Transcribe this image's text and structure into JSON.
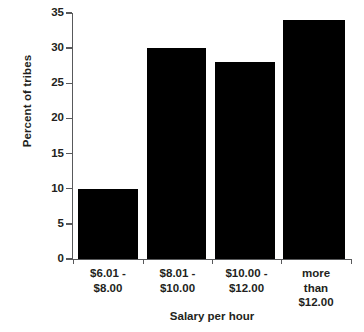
{
  "chart_data": {
    "type": "bar",
    "title": "",
    "categories": [
      "$6.01 - $8.00",
      "$8.01 - $10.00",
      "$10.00 - $12.00",
      "more than $12.00"
    ],
    "category_lines": [
      [
        "$6.01 -",
        "$8.00"
      ],
      [
        "$8.01 -",
        "$10.00"
      ],
      [
        "$10.00 -",
        "$12.00"
      ],
      [
        "more",
        "than",
        "$12.00"
      ]
    ],
    "values": [
      10,
      30,
      28,
      34
    ],
    "xlabel": "Salary per hour",
    "ylabel": "Percent of tribes",
    "ylim": [
      0,
      35
    ],
    "ytick_labels": [
      "0",
      "5",
      "10",
      "15",
      "20",
      "25",
      "30",
      "35"
    ],
    "ytick_values": [
      0,
      5,
      10,
      15,
      20,
      25,
      30,
      35
    ],
    "grid": false,
    "legend": "none",
    "bar_color": "#000000",
    "axis_color": "#58595b",
    "text_color": "#231f20",
    "background_color": "#ffffff"
  }
}
